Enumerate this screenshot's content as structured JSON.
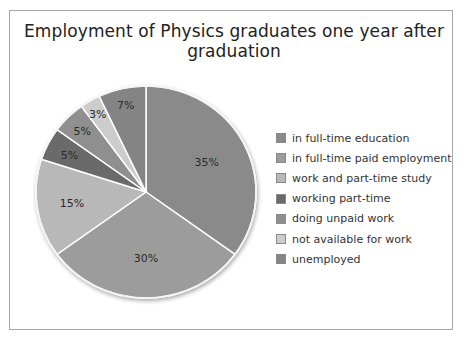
{
  "chart_data": {
    "type": "pie",
    "title": "Employment of Physics graduates one year after graduation",
    "categories": [
      "in full-time education",
      "in full-time paid employment",
      "work and part-time study",
      "working part-time",
      "doing unpaid work",
      "not available for work",
      "unemployed"
    ],
    "values": [
      35,
      30,
      15,
      5,
      5,
      3,
      7
    ],
    "labels": [
      "35%",
      "30%",
      "15%",
      "5%",
      "5%",
      "3%",
      "7%"
    ],
    "colors": [
      "#8a8a8a",
      "#9c9c9c",
      "#b8b8b8",
      "#6a6a6a",
      "#8f8f8f",
      "#cccccc",
      "#848484"
    ],
    "start_angle": "12 o'clock, clockwise",
    "legend_position": "right"
  },
  "title": "Employment of Physics graduates one year after graduation",
  "legend": [
    {
      "label": "in full-time education",
      "color": "#8a8a8a"
    },
    {
      "label": "in full-time paid employment",
      "color": "#9c9c9c"
    },
    {
      "label": "work and part-time study",
      "color": "#b8b8b8"
    },
    {
      "label": "working part-time",
      "color": "#6a6a6a"
    },
    {
      "label": "doing unpaid work",
      "color": "#8f8f8f"
    },
    {
      "label": "not available for work",
      "color": "#cccccc"
    },
    {
      "label": "unemployed",
      "color": "#848484"
    }
  ]
}
